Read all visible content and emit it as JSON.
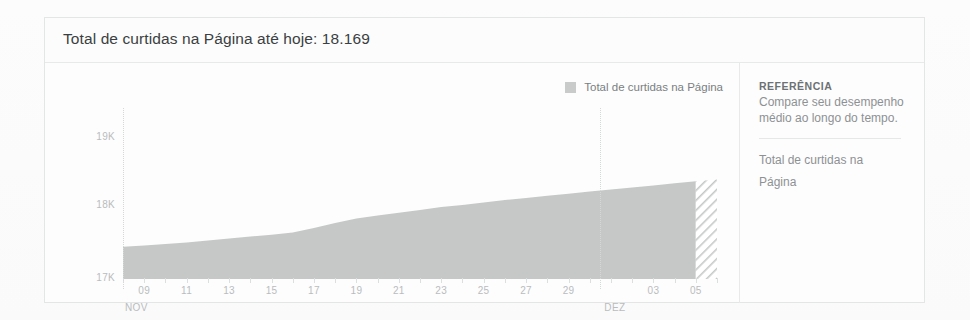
{
  "card": {
    "title": "Total de curtidas na Página até hoje: 18.169"
  },
  "legend": {
    "swatch_icon": "legend-swatch-icon",
    "label": "Total de curtidas na Página",
    "color": "#c9cbcb"
  },
  "sidebar": {
    "heading": "REFERÊNCIA",
    "description": "Compare seu desempenho médio ao longo do tempo.",
    "item_line1": "Total de curtidas na",
    "item_line2": "Página"
  },
  "chart_data": {
    "type": "area",
    "title": "Total de curtidas na Página até hoje: 18.169",
    "xlabel": "",
    "ylabel": "",
    "ylim": [
      17000,
      19000
    ],
    "yticks": [
      17000,
      18000,
      19000
    ],
    "ytick_labels": [
      "17K",
      "18K",
      "19K"
    ],
    "grid": false,
    "legend_position": "top-right",
    "series_name": "Total de curtidas na Página",
    "fill_color": "#c6c8c8",
    "x": [
      "08",
      "09",
      "10",
      "11",
      "12",
      "13",
      "14",
      "15",
      "16",
      "17",
      "18",
      "19",
      "20",
      "21",
      "22",
      "23",
      "24",
      "25",
      "26",
      "27",
      "28",
      "29",
      "30",
      "01",
      "02",
      "03",
      "04",
      "05",
      "06"
    ],
    "xtick_labels": [
      "09",
      "11",
      "13",
      "15",
      "17",
      "19",
      "21",
      "23",
      "25",
      "27",
      "29",
      "03",
      "05"
    ],
    "months": [
      "NOV",
      "DEZ"
    ],
    "month_separator_after": "30",
    "values": [
      17380,
      17395,
      17412,
      17430,
      17452,
      17478,
      17500,
      17520,
      17548,
      17600,
      17660,
      17712,
      17748,
      17780,
      17812,
      17846,
      17872,
      17900,
      17928,
      17952,
      17980,
      18004,
      18030,
      18052,
      18078,
      18100,
      18126,
      18150,
      18169
    ],
    "partial_data_band": {
      "label": "dados parciais",
      "pattern": "diagonal-hatch",
      "from_x": "05",
      "to_x": "06"
    }
  }
}
